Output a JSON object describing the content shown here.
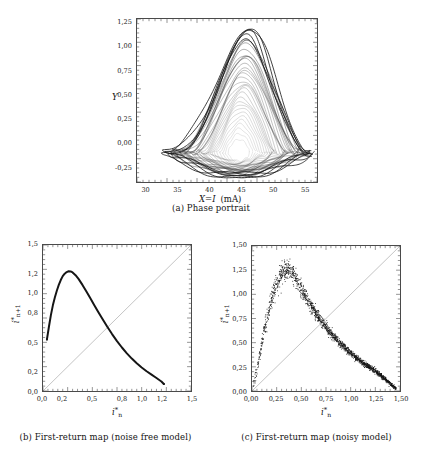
{
  "figure": {
    "background": "#ffffff",
    "ink": "#1a1a1a"
  },
  "panels": [
    {
      "id": "a",
      "caption": "(a) Phase portrait",
      "xlabel_main": "X=I",
      "xlabel_unit": "(mA)",
      "ylabel": "Y",
      "xticks": [
        "30",
        "35",
        "40",
        "45",
        "50",
        "55"
      ],
      "yticks": [
        "1,25",
        "1,00",
        "0,75",
        "0,50",
        "0,25",
        "0,00",
        "-0,25"
      ]
    },
    {
      "id": "b",
      "caption": "(b) First-return map (noise free model)",
      "xlabel": "i",
      "xlabel_sub": "n",
      "ylabel": "i",
      "ylabel_sub": "n+1",
      "xticks": [
        "0,0",
        "0,2",
        "0,5",
        "0,8",
        "1,0",
        "1,2",
        "1,5"
      ],
      "yticks": [
        "1,5",
        "1,2",
        "1,0",
        "0,8",
        "0,5",
        "0,2",
        "0,0"
      ]
    },
    {
      "id": "c",
      "caption": "(c) First-return map (noisy model)",
      "xlabel": "i",
      "xlabel_sub": "n",
      "ylabel": "i",
      "ylabel_sub": "n+1",
      "xticks": [
        "0,00",
        "0,25",
        "0,50",
        "0,75",
        "1,00",
        "1,25",
        "1,50"
      ],
      "yticks": [
        "1,50",
        "1,25",
        "1,00",
        "0,75",
        "0,50",
        "0,25",
        "0,00"
      ]
    }
  ],
  "chart_data": [
    {
      "type": "line",
      "panel": "a",
      "title": "Phase portrait",
      "xlabel": "X=I (mA)",
      "ylabel": "Y",
      "xlim": [
        28.5,
        57.0
      ],
      "ylim": [
        -0.33,
        1.37
      ],
      "grid": false,
      "legend": null,
      "description": "Chaotic attractor: nested triangular/teardrop orbits wound around a small unstable focus hole near (44.5, 0.0); dense outer boundary reaching apex near (46, 1.27) and a flat lower branch near Y = -0.22.",
      "attractor": {
        "apex": [
          46.0,
          1.27
        ],
        "left_corner": [
          33.2,
          -0.03
        ],
        "right_corner": [
          54.6,
          -0.2
        ],
        "hole_center": [
          44.6,
          -0.02
        ],
        "hole_radius_x": 1.25,
        "hole_radius_y": 0.085,
        "n_orbits": 34
      }
    },
    {
      "type": "line",
      "panel": "b",
      "title": "First-return map (noise free model)",
      "xlabel": "i*_n",
      "ylabel": "i*_{n+1}",
      "xlim": [
        0.0,
        1.5
      ],
      "ylim": [
        0.0,
        1.5
      ],
      "grid": false,
      "legend": null,
      "series": [
        {
          "name": "first-return map",
          "x": [
            0.04,
            0.06,
            0.08,
            0.1,
            0.12,
            0.14,
            0.16,
            0.18,
            0.2,
            0.22,
            0.24,
            0.26,
            0.28,
            0.3,
            0.33,
            0.36,
            0.4,
            0.44,
            0.48,
            0.52,
            0.56,
            0.6,
            0.65,
            0.7,
            0.75,
            0.8,
            0.85,
            0.9,
            0.95,
            1.0,
            1.05,
            1.1,
            1.15,
            1.2,
            1.225
          ],
          "y": [
            0.53,
            0.66,
            0.78,
            0.88,
            0.96,
            1.03,
            1.09,
            1.14,
            1.18,
            1.205,
            1.222,
            1.23,
            1.228,
            1.218,
            1.19,
            1.152,
            1.09,
            1.022,
            0.952,
            0.882,
            0.812,
            0.745,
            0.662,
            0.585,
            0.513,
            0.447,
            0.387,
            0.333,
            0.285,
            0.242,
            0.203,
            0.168,
            0.134,
            0.098,
            0.072
          ]
        },
        {
          "name": "identity y=x",
          "x": [
            0.0,
            1.5
          ],
          "y": [
            0.0,
            1.5
          ]
        }
      ]
    },
    {
      "type": "scatter",
      "panel": "c",
      "title": "First-return map (noisy model)",
      "xlabel": "i*_n",
      "ylabel": "i*_{n+1}",
      "xlim": [
        0.0,
        1.5
      ],
      "ylim": [
        0.0,
        1.5
      ],
      "grid": false,
      "legend": null,
      "n_points": 1700,
      "description": "Noisy first-return map: dense cloud of points along a unimodal curve rising steeply from the origin, peaking near i*_n = 0.30 with i*_{n+1} ~ 1.30, then decaying toward (1.45, 0.02). Scatter is widest (approximately +/-0.10) near the peak and narrow at both ends.",
      "ridge": {
        "x": [
          0.01,
          0.03,
          0.05,
          0.07,
          0.09,
          0.11,
          0.13,
          0.15,
          0.175,
          0.2,
          0.23,
          0.26,
          0.29,
          0.32,
          0.35,
          0.38,
          0.42,
          0.46,
          0.5,
          0.55,
          0.6,
          0.65,
          0.7,
          0.75,
          0.8,
          0.85,
          0.9,
          0.95,
          1.0,
          1.06,
          1.12,
          1.18,
          1.24,
          1.3,
          1.36,
          1.42,
          1.46
        ],
        "y": [
          0.03,
          0.12,
          0.225,
          0.33,
          0.44,
          0.545,
          0.65,
          0.745,
          0.855,
          0.95,
          1.055,
          1.14,
          1.205,
          1.245,
          1.262,
          1.255,
          1.205,
          1.135,
          1.062,
          0.965,
          0.878,
          0.798,
          0.725,
          0.658,
          0.597,
          0.54,
          0.487,
          0.438,
          0.393,
          0.342,
          0.296,
          0.253,
          0.212,
          0.165,
          0.115,
          0.058,
          0.025
        ],
        "spread": [
          0.02,
          0.028,
          0.035,
          0.042,
          0.048,
          0.055,
          0.062,
          0.068,
          0.076,
          0.084,
          0.092,
          0.098,
          0.102,
          0.104,
          0.102,
          0.098,
          0.09,
          0.082,
          0.076,
          0.068,
          0.062,
          0.057,
          0.052,
          0.048,
          0.045,
          0.042,
          0.039,
          0.036,
          0.034,
          0.031,
          0.028,
          0.026,
          0.024,
          0.022,
          0.02,
          0.016,
          0.012
        ]
      },
      "identity_line": {
        "x": [
          0.0,
          1.5
        ],
        "y": [
          0.0,
          1.5
        ]
      }
    }
  ]
}
